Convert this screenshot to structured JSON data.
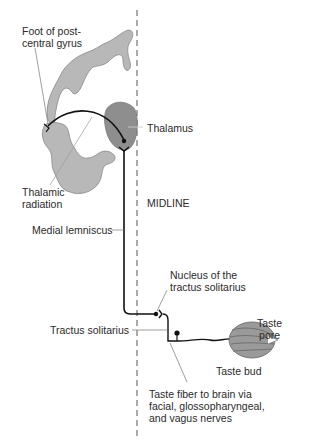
{
  "labels": {
    "foot_of_postcentral_gyrus": [
      "Foot of post-",
      "central gyrus"
    ],
    "thalamus": "Thalamus",
    "thalamic_radiation": [
      "Thalamic",
      "radiation"
    ],
    "midline": "MIDLINE",
    "medial_lemniscus": "Medial lemniscus",
    "nucleus_tractus_solitarius": [
      "Nucleus of the",
      "tractus solitarius"
    ],
    "tractus_solitarius": "Tractus solitarius",
    "taste_pore": [
      "Taste",
      "pore"
    ],
    "taste_bud": "Taste bud",
    "taste_fiber": [
      "Taste fiber to brain via",
      "facial, glossopharyngeal,",
      "and vagus nerves"
    ]
  },
  "colors": {
    "cortex_fill": "#b8b8b8",
    "thalamus_fill": "#8e8e8e",
    "pathway": "#111111",
    "leader": "#555555",
    "taste_bud_fill": "#9a9a9a"
  }
}
